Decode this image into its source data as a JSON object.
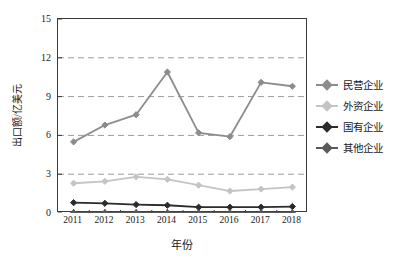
{
  "chart_data": {
    "type": "line",
    "title": "",
    "xlabel": "年份",
    "ylabel": "出口额/亿美元",
    "categories": [
      "2011",
      "2012",
      "2013",
      "2014",
      "2015",
      "2016",
      "2017",
      "2018"
    ],
    "x": [
      2011,
      2012,
      2013,
      2014,
      2015,
      2016,
      2017,
      2018
    ],
    "ylim": [
      0,
      15
    ],
    "yticks": [
      0,
      3,
      6,
      9,
      12,
      15
    ],
    "grid": "horizontal-dashed",
    "legend_position": "right",
    "series": [
      {
        "name": "民营企业",
        "color": "#8c8c8c",
        "marker": "diamond",
        "values": [
          5.5,
          6.8,
          7.6,
          10.9,
          6.2,
          5.9,
          10.1,
          9.8
        ]
      },
      {
        "name": "外资企业",
        "color": "#c4c4c4",
        "marker": "diamond",
        "values": [
          2.3,
          2.45,
          2.8,
          2.6,
          2.15,
          1.7,
          1.85,
          2.0
        ]
      },
      {
        "name": "国有企业",
        "color": "#2b2b2b",
        "marker": "diamond",
        "values": [
          0.8,
          0.75,
          0.65,
          0.6,
          0.45,
          0.45,
          0.45,
          0.5
        ]
      },
      {
        "name": "其他企业",
        "color": "#5a5a5a",
        "marker": "diamond",
        "values": [
          0.02,
          0.02,
          0.02,
          0.02,
          0.02,
          0.02,
          0.02,
          0.02
        ]
      }
    ]
  },
  "axes": {
    "y_tick_labels": [
      "15",
      "12",
      "9",
      "6",
      "3",
      "0"
    ],
    "x_tick_labels": [
      "2011",
      "2012",
      "2013",
      "2014",
      "2015",
      "2016",
      "2017",
      "2018"
    ],
    "y_axis_title": "出口额/亿美元",
    "x_axis_title": "年份"
  },
  "legend": {
    "items": [
      {
        "label": "民营企业",
        "color": "#8c8c8c"
      },
      {
        "label": "外资企业",
        "color": "#c4c4c4"
      },
      {
        "label": "国有企业",
        "color": "#2b2b2b"
      },
      {
        "label": "其他企业",
        "color": "#5a5a5a"
      }
    ]
  },
  "colors": {
    "frame": "#3b3b3b",
    "grid": "#9a9a9a",
    "background": "#ffffff",
    "text": "#1a1a1a"
  }
}
